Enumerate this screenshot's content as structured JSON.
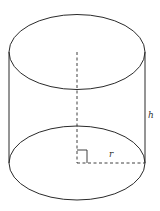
{
  "diagram": {
    "labels": {
      "height": "h",
      "radius": "r"
    },
    "colors": {
      "stroke": "#2a2a2a",
      "background": "#ffffff"
    },
    "annotations": {
      "right_angle_marker": true,
      "dashed_axis": true,
      "dashed_radius": true
    }
  }
}
